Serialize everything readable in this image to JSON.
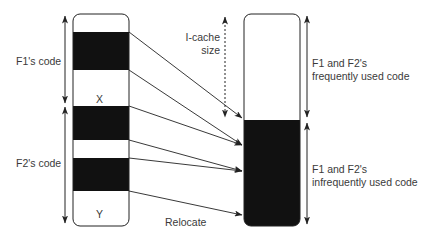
{
  "diagram": {
    "left_labels": {
      "f1_code": "F1's code",
      "f2_code": "F2's code",
      "x_marker": "X",
      "y_marker": "Y"
    },
    "middle_labels": {
      "icache_line1": "I-cache",
      "icache_line2": "size",
      "relocate": "Relocate"
    },
    "right_labels": {
      "frequent_line1": "F1 and F2's",
      "frequent_line2": "frequently used code",
      "infrequent_line1": "F1 and F2's",
      "infrequent_line2": "infrequently used code"
    },
    "colors": {
      "block_fill": "#111111",
      "outline": "#222222",
      "text": "#3a3a3a"
    }
  }
}
